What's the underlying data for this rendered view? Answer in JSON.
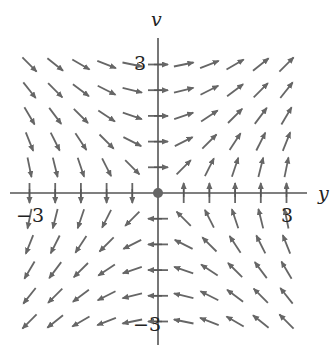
{
  "diagram": {
    "type": "vector_field",
    "title": "",
    "axes": {
      "horizontal_label": "y",
      "vertical_label": "v",
      "horizontal_range": [
        -3,
        3
      ],
      "vertical_range": [
        -3,
        3
      ],
      "tick_step": 0.6,
      "tick_labels": {
        "h_neg": "−3",
        "h_pos": "3",
        "v_pos": "3",
        "v_neg": "−3"
      }
    },
    "field": {
      "expression": "(dy/dt, dv/dt) = (v, y)",
      "grid_values": [
        -3,
        -2.4,
        -1.8,
        -1.2,
        -0.6,
        0,
        0.6,
        1.2,
        1.8,
        2.4,
        3
      ],
      "arrow_style": "normalized, equal length",
      "equilibrium_point": [
        0,
        0
      ]
    },
    "colors": {
      "arrow": "#666666",
      "axis": "#555555",
      "origin_dot": "#666666",
      "background": "#ffffff"
    }
  }
}
